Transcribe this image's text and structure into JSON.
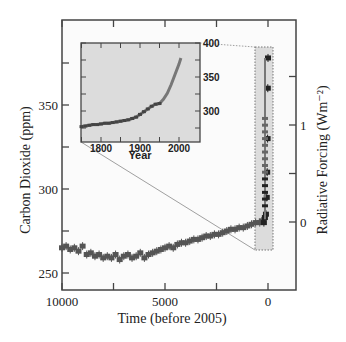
{
  "chart_data": {
    "type": "scatter",
    "title": "",
    "main": {
      "xlabel": "Time (before 2005)",
      "ylabel": "Carbon Dioxide (ppm)",
      "ylabel_right": "Radiative Forcing (Wm⁻²)",
      "xlim": [
        10000,
        -600
      ],
      "ylim": [
        240,
        385
      ],
      "xticks": [
        10000,
        7500,
        5000,
        2500,
        0
      ],
      "xtick_labels": [
        "10000",
        "",
        "5000",
        "",
        "0"
      ],
      "yticks": [
        250,
        275,
        300,
        325,
        350,
        375
      ],
      "ytick_labels": [
        "250",
        "",
        "300",
        "",
        "350",
        ""
      ],
      "yticks_right": [
        0,
        0.5,
        1,
        1.5
      ],
      "ytick_labels_right": [
        "0",
        "",
        "1",
        ""
      ],
      "grid": false,
      "series": [
        {
          "name": "Ice core CO2 (Holocene)",
          "marker": "square-with-errorbar",
          "color": "#555555",
          "x": [
            10000,
            9800,
            9600,
            9400,
            9200,
            9000,
            8800,
            8600,
            8400,
            8200,
            8000,
            7800,
            7600,
            7400,
            7200,
            7000,
            6800,
            6600,
            6400,
            6200,
            6000,
            5800,
            5600,
            5400,
            5200,
            5000,
            4800,
            4600,
            4400,
            4200,
            4000,
            3800,
            3600,
            3400,
            3200,
            3000,
            2800,
            2600,
            2400,
            2200,
            2000,
            1800,
            1600,
            1400,
            1200,
            1000,
            800,
            600,
            400,
            300,
            200,
            150,
            100,
            60,
            40,
            20,
            10,
            0
          ],
          "y": [
            265,
            266,
            264,
            265,
            263,
            266,
            261,
            262,
            260,
            261,
            259,
            260,
            259,
            261,
            258,
            260,
            261,
            259,
            260,
            262,
            259,
            261,
            262,
            263,
            264,
            265,
            266,
            265,
            267,
            268,
            268,
            269,
            270,
            270,
            271,
            272,
            272,
            273,
            273,
            274,
            275,
            276,
            276,
            277,
            277,
            278,
            279,
            280,
            280,
            281,
            280,
            283,
            285,
            295,
            310,
            330,
            360,
            378
          ]
        }
      ],
      "highlight_box": {
        "x_range": [
          300,
          -80
        ],
        "y_range": [
          267,
          382
        ],
        "style": "dotted",
        "fill": "#dcdcdc"
      }
    },
    "inset": {
      "xlabel": "Year",
      "ylabel": "",
      "xlim": [
        1750,
        2010
      ],
      "ylim": [
        270,
        400
      ],
      "xticks": [
        1750,
        1800,
        1850,
        1900,
        1950,
        2000
      ],
      "xtick_labels": [
        "",
        "1800",
        "",
        "1900",
        "",
        "2000"
      ],
      "yticks_right": [
        275,
        300,
        325,
        350,
        375,
        400
      ],
      "ytick_labels_right": [
        "",
        "300",
        "",
        "350",
        "",
        "400"
      ],
      "background": "#dcdcdc",
      "series": [
        {
          "name": "CO2 (1750-2005)",
          "color": "#444444",
          "x": [
            1750,
            1760,
            1770,
            1780,
            1790,
            1800,
            1810,
            1820,
            1830,
            1840,
            1850,
            1860,
            1870,
            1880,
            1890,
            1900,
            1910,
            1920,
            1930,
            1940,
            1950,
            1960,
            1970,
            1980,
            1990,
            2000,
            2005
          ],
          "y": [
            277,
            278,
            279,
            280,
            280,
            281,
            282,
            282,
            283,
            284,
            285,
            286,
            287,
            289,
            291,
            295,
            299,
            303,
            307,
            310,
            311,
            317,
            326,
            339,
            354,
            369,
            378
          ]
        }
      ]
    }
  }
}
